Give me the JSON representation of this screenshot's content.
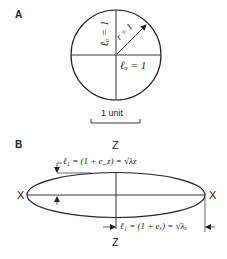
{
  "panel_a": {
    "label": "A",
    "vertical_length_label": "ℓₒ = 1",
    "horizontal_length_label": "ℓₒ = 1",
    "radius_label": "r = 1",
    "scale_label": "1 unit"
  },
  "panel_b": {
    "label": "B",
    "axis_z_top": "Z",
    "axis_z_bottom": "Z",
    "axis_x_left": "X",
    "axis_x_right": "X",
    "z_stretch_label": "ℓ₁ = (1 + e_z) = √λz",
    "x_stretch_label": "ℓ₁ = (1 + eₓ) = √λₓ"
  },
  "colors": {
    "stroke": "#222222",
    "background": "#ffffff"
  }
}
